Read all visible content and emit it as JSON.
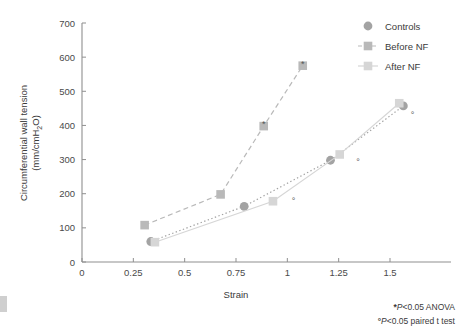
{
  "figure": {
    "background": "#ffffff",
    "axis_color": "#8f8f8f",
    "text_color": "#3a3a3a"
  },
  "axes": {
    "x": {
      "label": "Strain",
      "ticks": [
        0,
        0.25,
        0.5,
        0.75,
        1,
        1.25,
        1.5
      ],
      "tick_labels": [
        "0",
        "0.25",
        "0.5",
        "0.75",
        "1",
        "1.25",
        "1.5"
      ],
      "min": 0,
      "max": 1.6
    },
    "y": {
      "label_line1": "Circumferential wall tension",
      "label_line2": "(mm/cmH",
      "label_sub": "2",
      "label_line2_end": "O)",
      "ticks": [
        0,
        100,
        200,
        300,
        400,
        500,
        600,
        700
      ],
      "tick_labels": [
        "0",
        "100",
        "200",
        "300",
        "400",
        "500",
        "600",
        "700"
      ],
      "min": 0,
      "max": 700
    }
  },
  "legend": {
    "position": "top-right",
    "items": [
      {
        "label": "Controls",
        "marker": "circle",
        "color": "#a3a3a3",
        "line": "dotted"
      },
      {
        "label": "Before NF",
        "marker": "square",
        "color": "#b9b9b9",
        "line": "dashed"
      },
      {
        "label": "After NF",
        "marker": "square",
        "color": "#d6d6d6",
        "line": "solid"
      }
    ]
  },
  "notes": [
    {
      "symbol": "*",
      "text": "P<0.05 ANOVA"
    },
    {
      "symbol": "°",
      "text": "P<0.05 paired t test"
    }
  ],
  "chart_data": {
    "type": "scatter",
    "title": "",
    "xlabel": "Strain",
    "ylabel": "Circumferential wall tension (mm/cmH2O)",
    "xlim": [
      0,
      1.6
    ],
    "ylim": [
      0,
      700
    ],
    "grid": false,
    "legend_position": "top-right",
    "series": [
      {
        "name": "Controls",
        "marker": "circle",
        "color": "#a3a3a3",
        "linestyle": "dotted",
        "x": [
          0.335,
          0.79,
          1.21,
          1.565
        ],
        "y": [
          60,
          163,
          298,
          457
        ]
      },
      {
        "name": "Before NF",
        "marker": "square",
        "color": "#b9b9b9",
        "linestyle": "dashed",
        "x": [
          0.305,
          0.675,
          0.885,
          1.075
        ],
        "y": [
          108,
          198,
          398,
          575
        ],
        "annotations": [
          {
            "x": 0.885,
            "y": 398,
            "symbol": "*"
          },
          {
            "x": 1.075,
            "y": 575,
            "symbol": "*"
          }
        ]
      },
      {
        "name": "After NF",
        "marker": "square",
        "color": "#d6d6d6",
        "linestyle": "solid",
        "x": [
          0.355,
          0.93,
          1.255,
          1.545
        ],
        "y": [
          58,
          178,
          315,
          465
        ],
        "annotations": [
          {
            "x": 1.03,
            "y": 178,
            "symbol": "°"
          },
          {
            "x": 1.345,
            "y": 292,
            "symbol": "°"
          },
          {
            "x": 1.61,
            "y": 432,
            "symbol": "°"
          }
        ]
      }
    ]
  }
}
